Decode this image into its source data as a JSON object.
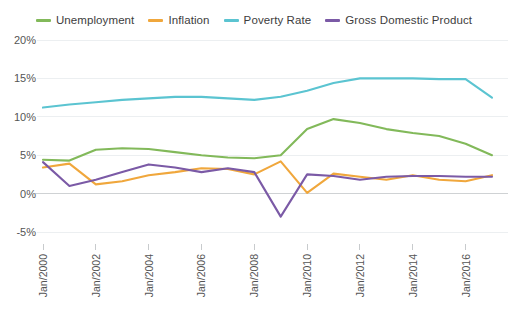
{
  "chart_data": {
    "type": "line",
    "title": "",
    "xlabel": "",
    "ylabel": "",
    "grid": true,
    "legend_position": "top-center",
    "ylim": [
      -5,
      20
    ],
    "y_ticks": [
      "-5%",
      "0%",
      "5%",
      "10%",
      "15%",
      "20%"
    ],
    "y_tick_values": [
      -5,
      0,
      5,
      10,
      15,
      20
    ],
    "x_tick_labels": [
      "Jan/2000",
      "Jan/2002",
      "Jan/2004",
      "Jan/2006",
      "Jan/2008",
      "Jan/2010",
      "Jan/2012",
      "Jan/2014",
      "Jan/2016"
    ],
    "x": [
      2000,
      2001,
      2002,
      2003,
      2004,
      2005,
      2006,
      2007,
      2008,
      2009,
      2010,
      2011,
      2012,
      2013,
      2014,
      2015,
      2016,
      2017
    ],
    "series": [
      {
        "name": "Unemployment",
        "color": "#82b95a",
        "values": [
          4.4,
          4.3,
          5.7,
          5.9,
          5.8,
          5.4,
          5.0,
          4.7,
          4.6,
          5.0,
          8.4,
          9.7,
          9.2,
          8.4,
          7.9,
          7.5,
          6.5,
          5.0
        ]
      },
      {
        "name": "Inflation",
        "color": "#f0a73c",
        "values": [
          3.4,
          3.9,
          1.2,
          1.6,
          2.4,
          2.8,
          3.3,
          3.2,
          2.5,
          4.2,
          0.1,
          2.6,
          2.2,
          1.8,
          2.4,
          1.8,
          1.6,
          2.4
        ]
      },
      {
        "name": "Poverty Rate",
        "color": "#5bc4d1",
        "values": [
          11.2,
          11.6,
          11.9,
          12.2,
          12.4,
          12.6,
          12.6,
          12.4,
          12.2,
          12.6,
          13.4,
          14.4,
          15.0,
          15.0,
          15.0,
          14.9,
          14.9,
          12.5
        ]
      },
      {
        "name": "Gross Domestic Product",
        "color": "#7b5aa6",
        "values": [
          4.1,
          1.0,
          1.8,
          2.8,
          3.8,
          3.4,
          2.8,
          3.3,
          2.8,
          -3.0,
          2.5,
          2.3,
          1.8,
          2.2,
          2.3,
          2.3,
          2.2,
          2.2
        ]
      }
    ]
  }
}
